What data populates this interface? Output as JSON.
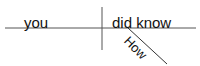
{
  "diagram": {
    "type": "sentence-diagram",
    "sentence": "How did you know",
    "subject": "you",
    "predicate": "did know",
    "modifiers": [
      {
        "word": "How",
        "modifies": "did know"
      }
    ],
    "line_color": "#555555",
    "text_color": "#111111"
  }
}
